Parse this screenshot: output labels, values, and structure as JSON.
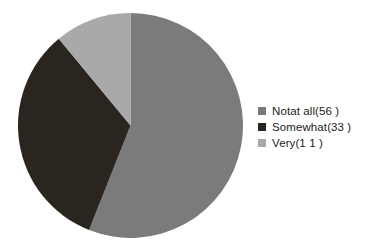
{
  "chart_data": {
    "type": "pie",
    "title": "",
    "subtitle": "",
    "xlabel": "",
    "ylabel": "",
    "grid": false,
    "legend_position": "right",
    "start_angle_deg": 0,
    "direction": "clockwise",
    "categories": [
      "Notat all",
      "Somewhat",
      "Very"
    ],
    "values": [
      56,
      33,
      11
    ],
    "units": "%",
    "labels": [
      "Notat all(56  )",
      "Somewhat(33  )",
      "Very(1 1  )"
    ],
    "colors": [
      "#7b7b7b",
      "#2b2520",
      "#a9a9a9"
    ],
    "slices": [
      {
        "label": "Notat all(56  )",
        "name": "Notat all",
        "value": 56,
        "color": "#7b7b7b"
      },
      {
        "label": "Somewhat(33  )",
        "name": "Somewhat",
        "value": 33,
        "color": "#2b2520"
      },
      {
        "label": "Very(1 1  )",
        "name": "Very",
        "value": 11,
        "color": "#a9a9a9"
      }
    ]
  },
  "legend": {
    "items": [
      {
        "label": "Notat all(56  )",
        "color": "#7b7b7b"
      },
      {
        "label": "Somewhat(33  )",
        "color": "#2b2520"
      },
      {
        "label": "Very(1 1  )",
        "color": "#a9a9a9"
      }
    ]
  },
  "background_color": "#ffffff"
}
